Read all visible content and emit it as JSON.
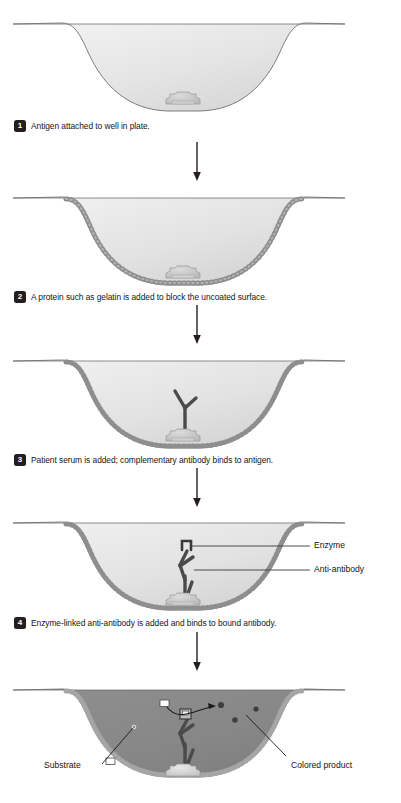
{
  "diagram": {
    "colors": {
      "well_fill_light": "#e6e6e6",
      "well_fill_colored": "#8a8a8a",
      "outline": "#6f6f6f",
      "bead_chain": "#8c8c8c",
      "antigen": "#c9c9c9",
      "antibody": "#4a4a4a",
      "badge_bg": "#231f20",
      "badge_text": "#ffffff",
      "text": "#141414"
    },
    "steps": [
      {
        "number": "1",
        "text": "Antigen attached to well in plate."
      },
      {
        "number": "2",
        "text": "A protein such as gelatin is added to block the uncoated surface."
      },
      {
        "number": "3",
        "text": "Patient serum is added; complementary antibody binds to antigen."
      },
      {
        "number": "4",
        "text": "Enzyme-linked anti-antibody is added and binds to bound antibody."
      }
    ],
    "callouts": {
      "enzyme": "Enzyme",
      "anti_antibody": "Anti-antibody",
      "substrate": "Substrate",
      "colored_product": "Colored product"
    },
    "icons": {
      "arrow": "down-arrow-icon",
      "antigen": "antigen-icon",
      "antibody": "antibody-icon",
      "enzyme": "enzyme-icon",
      "gelatin": "gelatin-chain-icon",
      "substrate_particle": "substrate-particle-icon",
      "product_particle": "colored-product-particle-icon"
    }
  }
}
